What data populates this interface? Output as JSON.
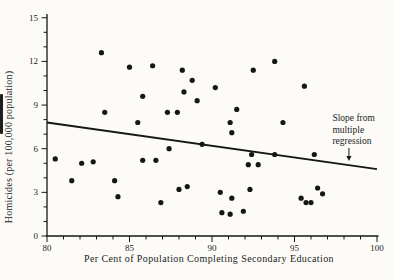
{
  "header": {
    "fragment": "Education and Crime"
  },
  "chart_data": {
    "type": "scatter",
    "title": "",
    "xlabel": "Per Cent of Population Completing Secondary Education",
    "ylabel": "Homicides (per 100,000 population)",
    "xlim": [
      80,
      100
    ],
    "ylim": [
      0,
      15
    ],
    "grid": false,
    "x_major_ticks": [
      80,
      85,
      90,
      95,
      100
    ],
    "x_minor_step": 1,
    "y_major_ticks": [
      0,
      3,
      6,
      9,
      12,
      15
    ],
    "y_minor_step": 1,
    "point_color": "#161616",
    "line_color": "#161616",
    "points": [
      [
        83.3,
        12.6
      ],
      [
        85.0,
        11.6
      ],
      [
        86.4,
        11.7
      ],
      [
        85.8,
        9.6
      ],
      [
        83.5,
        8.5
      ],
      [
        85.5,
        7.8
      ],
      [
        88.2,
        11.4
      ],
      [
        88.8,
        10.7
      ],
      [
        88.3,
        9.9
      ],
      [
        89.1,
        9.3
      ],
      [
        90.2,
        10.2
      ],
      [
        87.3,
        8.5
      ],
      [
        87.9,
        8.5
      ],
      [
        91.5,
        8.7
      ],
      [
        92.5,
        11.4
      ],
      [
        93.8,
        12.0
      ],
      [
        91.1,
        7.8
      ],
      [
        95.6,
        10.3
      ],
      [
        94.3,
        7.8
      ],
      [
        80.5,
        5.3
      ],
      [
        82.1,
        5.0
      ],
      [
        82.8,
        5.1
      ],
      [
        81.5,
        3.8
      ],
      [
        84.1,
        3.8
      ],
      [
        84.3,
        2.7
      ],
      [
        85.8,
        5.2
      ],
      [
        86.6,
        5.2
      ],
      [
        91.2,
        7.1
      ],
      [
        89.4,
        6.3
      ],
      [
        87.4,
        6.0
      ],
      [
        92.4,
        5.6
      ],
      [
        93.8,
        5.6
      ],
      [
        92.2,
        4.9
      ],
      [
        92.8,
        4.9
      ],
      [
        88.0,
        3.2
      ],
      [
        88.5,
        3.4
      ],
      [
        86.9,
        2.3
      ],
      [
        90.5,
        3.0
      ],
      [
        91.2,
        2.6
      ],
      [
        92.3,
        3.2
      ],
      [
        90.6,
        1.6
      ],
      [
        91.1,
        1.5
      ],
      [
        91.9,
        1.7
      ],
      [
        96.4,
        3.3
      ],
      [
        96.7,
        2.9
      ],
      [
        95.4,
        2.6
      ],
      [
        95.7,
        2.3
      ],
      [
        96.0,
        2.3
      ],
      [
        96.2,
        5.6
      ]
    ],
    "regression_line": {
      "x1": 80,
      "y1": 7.8,
      "x2": 100,
      "y2": 4.6
    },
    "annotation": {
      "lines": [
        "Slope from",
        "multiple",
        "regression"
      ],
      "text_x": 97.3,
      "text_first_baseline_y": 7.9,
      "arrow_x": 98.3,
      "arrow_tail_y": 6.05,
      "arrow_tip_y": 5.15
    }
  }
}
